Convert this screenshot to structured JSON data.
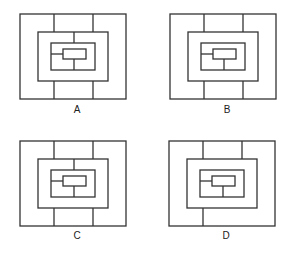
{
  "figures": [
    {
      "label": "A",
      "offset": [
        0,
        0
      ],
      "outer_top_dividers": [
        54,
        93
      ],
      "outer_bottom_dividers": [
        54,
        93
      ],
      "middle_top_divider": true,
      "inner_left_connector": true,
      "inner_bottom_connector": true
    },
    {
      "label": "B",
      "offset": [
        150,
        0
      ],
      "outer_top_dividers": [
        54,
        93
      ],
      "outer_bottom_dividers": [
        54,
        93
      ],
      "middle_top_divider": false,
      "inner_left_connector": true,
      "inner_bottom_connector": true
    },
    {
      "label": "C",
      "offset": [
        0,
        127
      ],
      "outer_top_dividers": [
        54,
        93
      ],
      "outer_bottom_dividers": [
        54,
        93
      ],
      "middle_top_divider": true,
      "inner_left_connector": true,
      "inner_bottom_connector": true
    },
    {
      "label": "D",
      "offset": [
        149,
        127
      ],
      "outer_top_dividers": [
        54,
        93
      ],
      "outer_bottom_dividers": [
        54
      ],
      "middle_top_divider": false,
      "inner_left_connector": true,
      "inner_bottom_connector": true
    }
  ],
  "stroke_color": "#333333"
}
